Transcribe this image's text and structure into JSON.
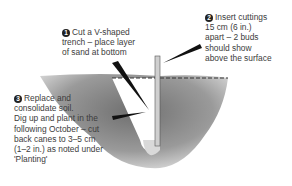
{
  "diagram": {
    "steps": [
      {
        "number": "1",
        "lines": [
          "Cut a V-shaped",
          "trench – place layer",
          "of sand at bottom"
        ]
      },
      {
        "number": "2",
        "lines": [
          "Insert cuttings",
          "15 cm (6 in.)",
          "apart – 2 buds",
          "should show",
          "above the surface"
        ]
      },
      {
        "number": "3",
        "lines": [
          "Replace and",
          "consolidate soil.",
          "Dig up and plant in the",
          "following October – cut",
          "back canes to 3–5 cm",
          "(1–2 in.) as noted under",
          "'Planting'"
        ]
      }
    ],
    "colors": {
      "soil": "#8a8a8a",
      "sand": "#d8d8d8",
      "text": "#3c3c3c",
      "pointer": "#111111"
    }
  }
}
